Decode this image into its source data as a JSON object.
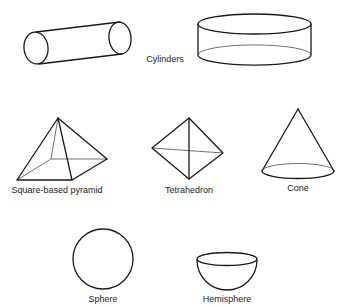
{
  "diagram": {
    "shapes": [
      {
        "id": "cylinder-horizontal",
        "group": "cylinders"
      },
      {
        "id": "cylinder-flat",
        "group": "cylinders"
      },
      {
        "id": "square-based-pyramid",
        "label": "Square-based pyramid"
      },
      {
        "id": "tetrahedron",
        "label": "Tetrahedron"
      },
      {
        "id": "cone",
        "label": "Cone"
      },
      {
        "id": "sphere",
        "label": "Sphere"
      },
      {
        "id": "hemisphere",
        "label": "Hemisphere"
      }
    ],
    "labels": {
      "cylinders": "Cylinders",
      "pyramid": "Square-based pyramid",
      "tetrahedron": "Tetrahedron",
      "cone": "Cone",
      "sphere": "Sphere",
      "hemisphere": "Hemisphere"
    },
    "colors": {
      "stroke": "#1a1a1a",
      "text": "#222222",
      "background": "#ffffff"
    }
  }
}
